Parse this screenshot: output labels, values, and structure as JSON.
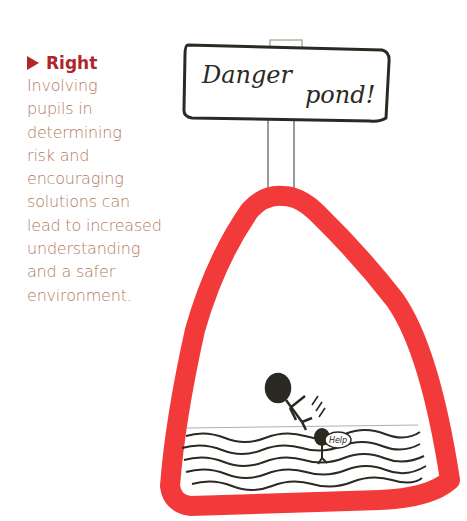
{
  "caption": {
    "heading": "Right",
    "lines": [
      "Involving",
      "pupils in",
      "determining",
      "risk and",
      "encouraging",
      "solutions can",
      "lead to increased",
      "understanding",
      "and a safer",
      "environment."
    ]
  },
  "drawing": {
    "sign_text_1": "Danger",
    "sign_text_2": "pond!",
    "speech_bubble": "Help",
    "colors": {
      "triangle": "#f23a3a",
      "heading": "#b0262b",
      "body_text": "#b27a5e",
      "ink": "#2a2a22"
    }
  }
}
